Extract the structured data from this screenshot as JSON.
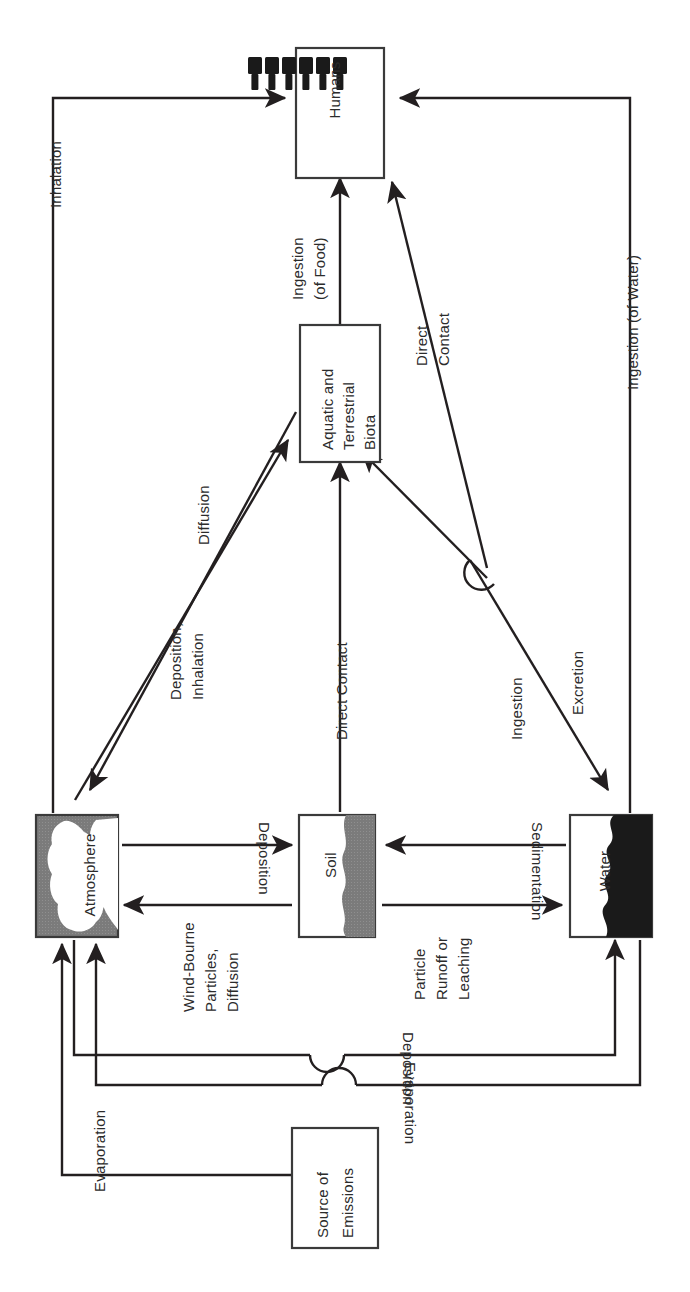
{
  "diagram": {
    "orientation": "rotated-90",
    "colors": {
      "line": "#231f20",
      "text": "#2b2b2b",
      "atmosphere_fill": "#7b7b7b",
      "atmosphere_cloud": "#ffffff",
      "soil_fill": "#7b7b7b",
      "water_fill": "#1a1a1a",
      "box_stroke": "#3a3a3a",
      "background": "#ffffff"
    },
    "nodes": [
      {
        "id": "humans",
        "label": "Humans",
        "icon": "people-icon",
        "lines": [
          "Humans"
        ]
      },
      {
        "id": "biota",
        "label": "Aquatic and Terrestrial Biota",
        "lines": [
          "Aquatic and",
          "Terrestrial",
          "Biota"
        ]
      },
      {
        "id": "atmosphere",
        "label": "Atmosphere",
        "lines": [
          "Atmosphere"
        ],
        "icon": "cloud-icon"
      },
      {
        "id": "soil",
        "label": "Soil",
        "lines": [
          "Soil"
        ]
      },
      {
        "id": "water",
        "label": "Water",
        "lines": [
          "Water"
        ]
      },
      {
        "id": "source",
        "label": "Source of Emissions",
        "lines": [
          "Source of",
          "Emissions"
        ]
      }
    ],
    "flows": [
      {
        "id": "inhalation",
        "label": "Inhalation",
        "lines": [
          "Inhalation"
        ],
        "from": "atmosphere",
        "to": "humans"
      },
      {
        "id": "ingestion-water",
        "label": "Ingestion (of Water)",
        "lines": [
          "Ingestion (of Water)"
        ],
        "from": "water",
        "to": "humans"
      },
      {
        "id": "ingestion-food",
        "label": "Ingestion (of Food)",
        "lines": [
          "Ingestion",
          "(of Food)"
        ],
        "from": "biota",
        "to": "humans"
      },
      {
        "id": "direct-contact-humans",
        "label": "Direct Contact",
        "lines": [
          "Direct",
          "Contact"
        ],
        "from": "water",
        "to": "humans"
      },
      {
        "id": "diffusion",
        "label": "Diffusion",
        "lines": [
          "Diffusion"
        ],
        "from": "biota",
        "to": "atmosphere"
      },
      {
        "id": "deposition-inhalation",
        "label": "Deposition, Inhalation",
        "lines": [
          "Deposition,",
          "Inhalation"
        ],
        "from": "atmosphere",
        "to": "biota"
      },
      {
        "id": "direct-contact-soil",
        "label": "Direct Contact",
        "lines": [
          "Direct Contact"
        ],
        "from": "soil",
        "to": "biota"
      },
      {
        "id": "ingestion-biota",
        "label": "Ingestion",
        "lines": [
          "Ingestion"
        ],
        "from": "water",
        "to": "biota"
      },
      {
        "id": "excretion",
        "label": "Excretion",
        "lines": [
          "Excretion"
        ],
        "from": "biota",
        "to": "water"
      },
      {
        "id": "deposition-soil",
        "label": "Deposition",
        "lines": [
          "Deposition"
        ],
        "from": "atmosphere",
        "to": "soil"
      },
      {
        "id": "wind-bourne",
        "label": "Wind-Bourne Particles, Diffusion",
        "lines": [
          "Wind-Bourne",
          "Particles,",
          "Diffusion"
        ],
        "from": "soil",
        "to": "atmosphere"
      },
      {
        "id": "sedimentation",
        "label": "Sedimentation",
        "lines": [
          "Sedimentation"
        ],
        "from": "water",
        "to": "soil"
      },
      {
        "id": "particle-runoff",
        "label": "Particle Runoff or Leaching",
        "lines": [
          "Particle",
          "Runoff or",
          "Leaching"
        ],
        "from": "soil",
        "to": "water"
      },
      {
        "id": "deposition-source",
        "label": "Deposition",
        "lines": [
          "Deposition"
        ],
        "from": "atmosphere",
        "to": "water"
      },
      {
        "id": "evaporation-source",
        "label": "Evaporation",
        "lines": [
          "Evaporation"
        ],
        "from": "source",
        "to": "atmosphere"
      },
      {
        "id": "evaporation-bottom",
        "label": "Evaporation",
        "lines": [
          "Evaporation"
        ],
        "from": "water",
        "to": "atmosphere"
      }
    ]
  }
}
